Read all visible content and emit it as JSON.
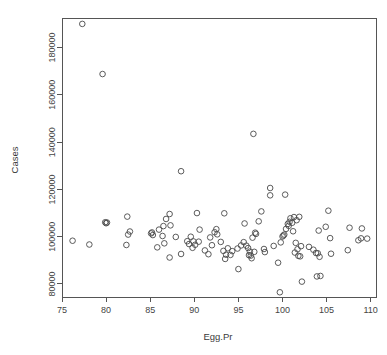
{
  "chart_data": {
    "type": "scatter",
    "title": "",
    "xlabel": "Egg.Pr",
    "ylabel": "Cases",
    "xlim": [
      75.0,
      110.6
    ],
    "ylim": [
      74500,
      192500
    ],
    "grid": false,
    "legend": null,
    "xticks": [
      75,
      80,
      85,
      90,
      95,
      100,
      105,
      110
    ],
    "xticklabels": [
      "75",
      "80",
      "85",
      "90",
      "95",
      "100",
      "105",
      "110"
    ],
    "yticks": [
      80000,
      100000,
      120000,
      140000,
      160000,
      180000
    ],
    "yticklabels": [
      "80000",
      "100000",
      "120000",
      "140000",
      "160000",
      "180000"
    ],
    "marker": "open-circle",
    "marker_color": "#4a4a4a",
    "points": [
      {
        "x": 77.3,
        "y": 190000
      },
      {
        "x": 79.6,
        "y": 168800
      },
      {
        "x": 96.7,
        "y": 143500
      },
      {
        "x": 88.5,
        "y": 127700
      },
      {
        "x": 98.6,
        "y": 120600
      },
      {
        "x": 100.3,
        "y": 117800
      },
      {
        "x": 98.6,
        "y": 117500
      },
      {
        "x": 105.2,
        "y": 111000
      },
      {
        "x": 97.6,
        "y": 110700
      },
      {
        "x": 90.3,
        "y": 110000
      },
      {
        "x": 93.4,
        "y": 109900
      },
      {
        "x": 87.2,
        "y": 109600
      },
      {
        "x": 82.4,
        "y": 108500
      },
      {
        "x": 101.9,
        "y": 108400
      },
      {
        "x": 101.3,
        "y": 108300
      },
      {
        "x": 100.9,
        "y": 107800
      },
      {
        "x": 86.8,
        "y": 107500
      },
      {
        "x": 101.6,
        "y": 107000
      },
      {
        "x": 97.3,
        "y": 106500
      },
      {
        "x": 100.8,
        "y": 106300
      },
      {
        "x": 101.1,
        "y": 105900
      },
      {
        "x": 95.7,
        "y": 105600
      },
      {
        "x": 100.6,
        "y": 105400
      },
      {
        "x": 87.3,
        "y": 104800
      },
      {
        "x": 86.5,
        "y": 104500
      },
      {
        "x": 79.9,
        "y": 106100
      },
      {
        "x": 80.1,
        "y": 106000
      },
      {
        "x": 80.0,
        "y": 105700
      },
      {
        "x": 100.7,
        "y": 104600
      },
      {
        "x": 104.9,
        "y": 104200
      },
      {
        "x": 107.6,
        "y": 103800
      },
      {
        "x": 109.0,
        "y": 103500
      },
      {
        "x": 100.4,
        "y": 103300
      },
      {
        "x": 92.5,
        "y": 103200
      },
      {
        "x": 86.0,
        "y": 103000
      },
      {
        "x": 90.6,
        "y": 103000
      },
      {
        "x": 104.1,
        "y": 102600
      },
      {
        "x": 101.2,
        "y": 102300
      },
      {
        "x": 82.7,
        "y": 102200
      },
      {
        "x": 85.2,
        "y": 101800
      },
      {
        "x": 85.1,
        "y": 101400
      },
      {
        "x": 92.3,
        "y": 101900
      },
      {
        "x": 96.9,
        "y": 101700
      },
      {
        "x": 97.0,
        "y": 101200
      },
      {
        "x": 92.6,
        "y": 101000
      },
      {
        "x": 82.5,
        "y": 100900
      },
      {
        "x": 85.3,
        "y": 100700
      },
      {
        "x": 100.2,
        "y": 100900
      },
      {
        "x": 100.1,
        "y": 100500
      },
      {
        "x": 100.0,
        "y": 100100
      },
      {
        "x": 86.4,
        "y": 100300
      },
      {
        "x": 89.6,
        "y": 100000
      },
      {
        "x": 87.9,
        "y": 99900
      },
      {
        "x": 91.8,
        "y": 99700
      },
      {
        "x": 96.6,
        "y": 99600
      },
      {
        "x": 105.4,
        "y": 99400
      },
      {
        "x": 108.9,
        "y": 99300
      },
      {
        "x": 109.6,
        "y": 99200
      },
      {
        "x": 76.2,
        "y": 98300
      },
      {
        "x": 89.2,
        "y": 98100
      },
      {
        "x": 89.9,
        "y": 98000
      },
      {
        "x": 90.5,
        "y": 97900
      },
      {
        "x": 93.0,
        "y": 97800
      },
      {
        "x": 95.6,
        "y": 97700
      },
      {
        "x": 99.8,
        "y": 97600
      },
      {
        "x": 101.5,
        "y": 97400
      },
      {
        "x": 108.6,
        "y": 98500
      },
      {
        "x": 78.1,
        "y": 96700
      },
      {
        "x": 82.3,
        "y": 96500
      },
      {
        "x": 86.6,
        "y": 97200
      },
      {
        "x": 89.4,
        "y": 96900
      },
      {
        "x": 90.1,
        "y": 96600
      },
      {
        "x": 92.0,
        "y": 96400
      },
      {
        "x": 95.3,
        "y": 96300
      },
      {
        "x": 95.9,
        "y": 96200
      },
      {
        "x": 99.0,
        "y": 96100
      },
      {
        "x": 102.1,
        "y": 96000
      },
      {
        "x": 103.0,
        "y": 95700
      },
      {
        "x": 85.8,
        "y": 95500
      },
      {
        "x": 89.8,
        "y": 95300
      },
      {
        "x": 93.8,
        "y": 95100
      },
      {
        "x": 94.9,
        "y": 95000
      },
      {
        "x": 96.1,
        "y": 95200
      },
      {
        "x": 97.9,
        "y": 94800
      },
      {
        "x": 101.7,
        "y": 94700
      },
      {
        "x": 103.5,
        "y": 94500
      },
      {
        "x": 107.4,
        "y": 94300
      },
      {
        "x": 91.2,
        "y": 94200
      },
      {
        "x": 93.3,
        "y": 94000
      },
      {
        "x": 94.3,
        "y": 93900
      },
      {
        "x": 96.3,
        "y": 93700
      },
      {
        "x": 96.8,
        "y": 93600
      },
      {
        "x": 98.0,
        "y": 93500
      },
      {
        "x": 101.4,
        "y": 93300
      },
      {
        "x": 103.8,
        "y": 93100
      },
      {
        "x": 104.0,
        "y": 93000
      },
      {
        "x": 105.5,
        "y": 92800
      },
      {
        "x": 88.5,
        "y": 92700
      },
      {
        "x": 91.6,
        "y": 92600
      },
      {
        "x": 93.6,
        "y": 92400
      },
      {
        "x": 94.1,
        "y": 92300
      },
      {
        "x": 96.2,
        "y": 92200
      },
      {
        "x": 96.4,
        "y": 92000
      },
      {
        "x": 101.8,
        "y": 91900
      },
      {
        "x": 102.0,
        "y": 91700
      },
      {
        "x": 104.2,
        "y": 91500
      },
      {
        "x": 87.2,
        "y": 91200
      },
      {
        "x": 93.5,
        "y": 90600
      },
      {
        "x": 96.5,
        "y": 90900
      },
      {
        "x": 99.5,
        "y": 89000
      },
      {
        "x": 95.0,
        "y": 86300
      },
      {
        "x": 103.9,
        "y": 83200
      },
      {
        "x": 104.3,
        "y": 83400
      },
      {
        "x": 102.2,
        "y": 81000
      },
      {
        "x": 99.7,
        "y": 76500
      }
    ]
  },
  "figure": {
    "width": 387,
    "height": 355,
    "background": "#ffffff",
    "axis_color": "#555555",
    "text_color": "#3a3a3a"
  }
}
